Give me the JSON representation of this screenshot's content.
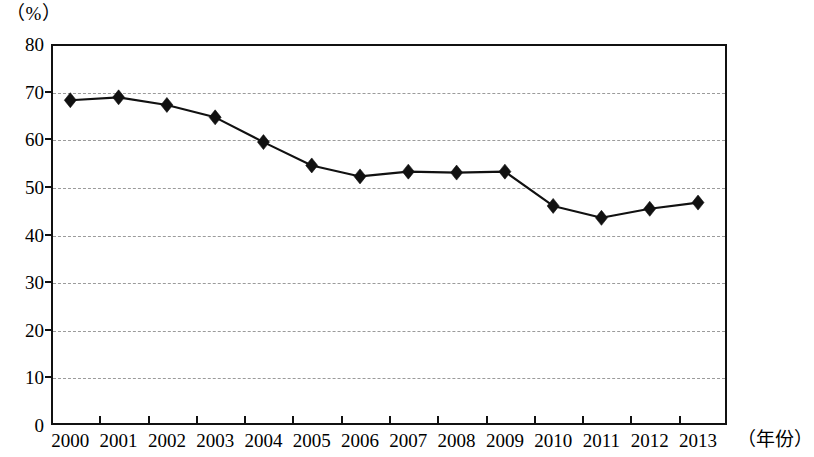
{
  "chart_data": {
    "type": "line",
    "title": "",
    "subtitle": "",
    "xlabel": "（年份）",
    "ylabel": "（%）",
    "categories": [
      "2000",
      "2001",
      "2002",
      "2003",
      "2004",
      "2005",
      "2006",
      "2007",
      "2008",
      "2009",
      "2010",
      "2011",
      "2012",
      "2013"
    ],
    "values": [
      68.2,
      68.8,
      67.2,
      64.6,
      59.4,
      54.5,
      52.2,
      53.2,
      53.0,
      53.2,
      46.0,
      43.5,
      45.4,
      46.7
    ],
    "series": [
      {
        "name": "",
        "values": [
          68.2,
          68.8,
          67.2,
          64.6,
          59.4,
          54.5,
          52.2,
          53.2,
          53.0,
          53.2,
          46.0,
          43.5,
          45.4,
          46.7
        ]
      }
    ],
    "ylim": [
      0,
      80
    ],
    "y_ticks": [
      0,
      10,
      20,
      30,
      40,
      50,
      60,
      70,
      80
    ],
    "y_tick_labels": [
      "0",
      "10",
      "20",
      "30",
      "40",
      "50",
      "60",
      "70",
      "80"
    ],
    "x_tick_labels": [
      "2000",
      "2001",
      "2002",
      "2003",
      "2004",
      "2005",
      "2006",
      "2007",
      "2008",
      "2009",
      "2010",
      "2011",
      "2012",
      "2013"
    ],
    "grid": true,
    "grid_orientation": "horizontal",
    "grid_style": "dashed",
    "legend": null,
    "legend_position": "none",
    "marker": "diamond",
    "annotations": [],
    "colors": {
      "line": "#111111",
      "marker": "#111111",
      "grid": "#9b9b9b",
      "axis": "#111111",
      "background": "#ffffff"
    }
  },
  "axis_captions": {
    "y_unit": "（%）",
    "x_unit": "（年份）"
  }
}
